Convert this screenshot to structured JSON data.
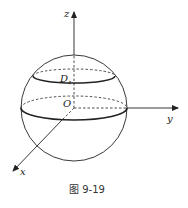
{
  "figure": {
    "caption": "图 9-19",
    "axes": {
      "x_label": "x",
      "y_label": "y",
      "z_label": "z"
    },
    "origin_label": "O",
    "region_label": "D",
    "region_subscript": "z",
    "colors": {
      "stroke": "#222222",
      "background": "#ffffff"
    }
  }
}
